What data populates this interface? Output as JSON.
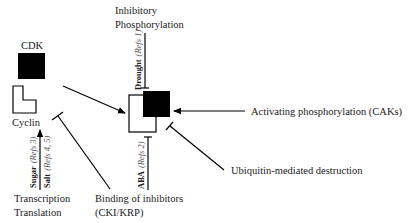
{
  "diagram": {
    "components": {
      "cdk_label": "CDK",
      "cyclin_label": "Cyclin"
    },
    "regulators": {
      "inhibitory_line1": "Inhibitory",
      "inhibitory_line2": "Phosphorylation",
      "activating": "Activating phosphorylation (CAKs)",
      "ubiquitin": "Ubiquitin-mediated destruction",
      "binding_line1": "Binding of inhibitors",
      "binding_line2": "(CKI/KRP)",
      "transcription_line1": "Transcription",
      "transcription_line2": "Translation"
    },
    "stresses": {
      "drought": {
        "bold": "Drought",
        "ref": "(Refs 1)"
      },
      "aba": {
        "bold": "ABA",
        "ref": "(Refs 2)"
      },
      "sugar": {
        "bold": "Sugar",
        "ref": "(Refs 3)"
      },
      "salt": {
        "bold": "Salt",
        "ref": "(Refs 4, 5)"
      }
    },
    "colors": {
      "ink": "#000000",
      "text": "#1a1a1a",
      "ref_text": "#555555"
    }
  }
}
